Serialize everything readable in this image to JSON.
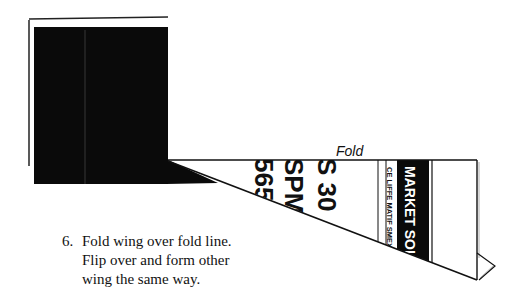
{
  "diagram": {
    "fold_label": "Fold",
    "step": {
      "number": "6.",
      "lines": [
        "Fold wing over fold line.",
        "Flip over and form other",
        "wing the same way."
      ]
    },
    "paper_text": {
      "large_rows": [
        "565",
        "SPM",
        "S 30"
      ],
      "market_list": "CE  LIFFE  MATIF  SMEX",
      "banner": "MARKET SOLD"
    },
    "colors": {
      "ink": "#111111",
      "paper": "#ffffff",
      "fill": "#0a0a0a"
    }
  }
}
